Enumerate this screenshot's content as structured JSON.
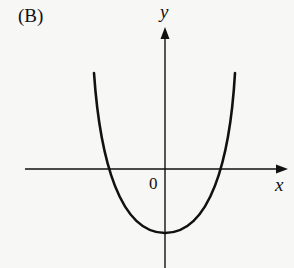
{
  "figure": {
    "option_label": "(B)",
    "axes": {
      "x_label": "x",
      "y_label": "y",
      "origin_label": "0"
    },
    "curve": {
      "type": "parabola",
      "opens": "up",
      "description": "Upward-opening parabola with vertex on the negative y-axis, crossing the x-axis at one negative and one positive x-value"
    },
    "colors": {
      "ink": "#111111",
      "background": "#f7f7f5"
    }
  }
}
